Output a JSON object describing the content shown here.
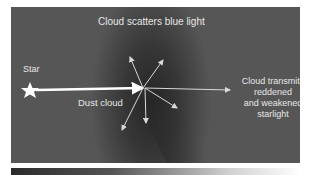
{
  "diagram": {
    "title": "Cloud scatters blue light",
    "labels": {
      "star": "Star",
      "dust_cloud": "Dust cloud",
      "transmit_line1": "Cloud transmits",
      "transmit_line2": "reddened",
      "transmit_line3": "and weakened",
      "transmit_line4": "starlight"
    },
    "colors": {
      "background_dark": "#262626",
      "background_light": "#565656",
      "text": "#e6e6e6",
      "arrows": "#d9d9d9",
      "star": "#ffffff"
    },
    "elements": [
      {
        "id": "star-icon",
        "shape": "star"
      },
      {
        "id": "incoming-ray",
        "shape": "thick-arrow",
        "direction": "right"
      },
      {
        "id": "scatter-arrows",
        "count": 5
      },
      {
        "id": "transmitted-ray",
        "shape": "thin-arrow",
        "direction": "right"
      }
    ]
  }
}
